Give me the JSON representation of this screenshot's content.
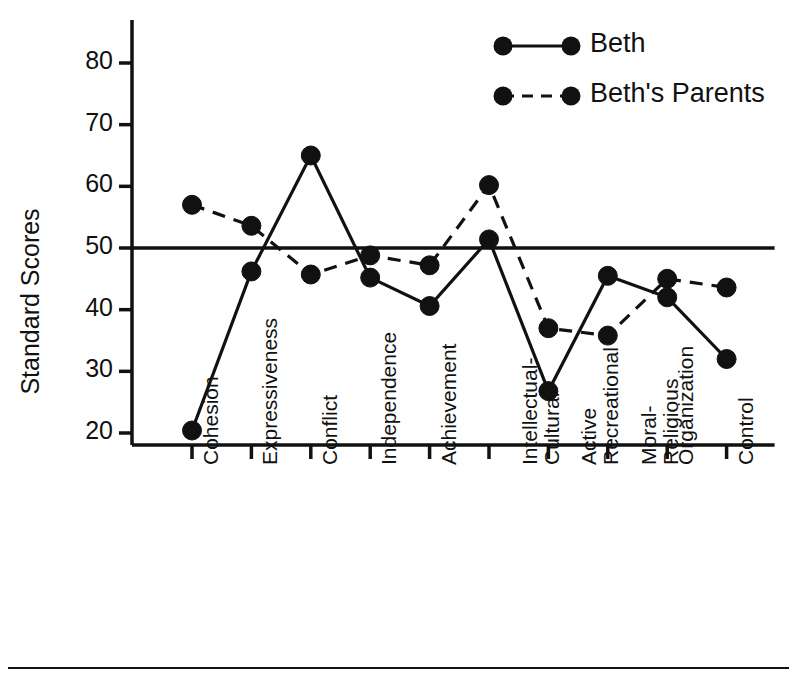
{
  "chart_data": {
    "type": "line",
    "title": "",
    "xlabel": "",
    "ylabel": "Standard Scores",
    "ylim": [
      20,
      85
    ],
    "yticks": [
      20,
      30,
      40,
      50,
      60,
      70,
      80
    ],
    "ytick_labels": [
      "20",
      "30",
      "40",
      "50",
      "60",
      "70",
      "80"
    ],
    "grid": false,
    "reference_line": 50,
    "legend_position": "top-right",
    "categories": [
      "Cohesion",
      "Expressiveness",
      "Conflict",
      "Independence",
      "Achievement",
      "Intellectual-Cultural",
      "Active Recreational",
      "Moral-Religious",
      "Organization",
      "Control"
    ],
    "category_lines": [
      [
        "Cohesion",
        ""
      ],
      [
        "Expressiveness",
        ""
      ],
      [
        "Conflict",
        ""
      ],
      [
        "Independence",
        ""
      ],
      [
        "Achievement",
        ""
      ],
      [
        "Intellectual-",
        "Cultural"
      ],
      [
        "Active",
        "Recreational"
      ],
      [
        "Moral-",
        "Religious"
      ],
      [
        "Organization",
        ""
      ],
      [
        "Control",
        ""
      ]
    ],
    "series": [
      {
        "name": "Beth",
        "style": "solid",
        "color": "#111111",
        "values": [
          20.4,
          46.2,
          65.0,
          45.2,
          40.6,
          51.4,
          26.8,
          45.5,
          42.0,
          32.0
        ]
      },
      {
        "name": "Beth's Parents",
        "style": "dashed",
        "color": "#111111",
        "values": [
          57.0,
          53.6,
          45.7,
          48.8,
          47.2,
          60.2,
          37.0,
          35.8,
          45.0,
          43.6
        ]
      }
    ]
  },
  "legend": {
    "entries": [
      {
        "label": "Beth",
        "style": "solid"
      },
      {
        "label": "Beth's Parents",
        "style": "dashed"
      }
    ]
  },
  "axis": {
    "y_title": "Standard Scores"
  },
  "footer": {
    "rule": ""
  }
}
